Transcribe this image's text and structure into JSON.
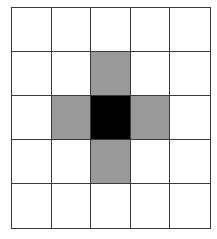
{
  "grid": {
    "rows": 5,
    "cols": 5,
    "cells": [
      [
        "white",
        "white",
        "white",
        "white",
        "white"
      ],
      [
        "white",
        "white",
        "gray",
        "white",
        "white"
      ],
      [
        "white",
        "gray",
        "black",
        "gray",
        "white"
      ],
      [
        "white",
        "white",
        "gray",
        "white",
        "white"
      ],
      [
        "white",
        "white",
        "white",
        "white",
        "white"
      ]
    ],
    "colors": {
      "white": "#ffffff",
      "gray": "#999999",
      "black": "#000000",
      "line": "#3a3a3a"
    }
  }
}
